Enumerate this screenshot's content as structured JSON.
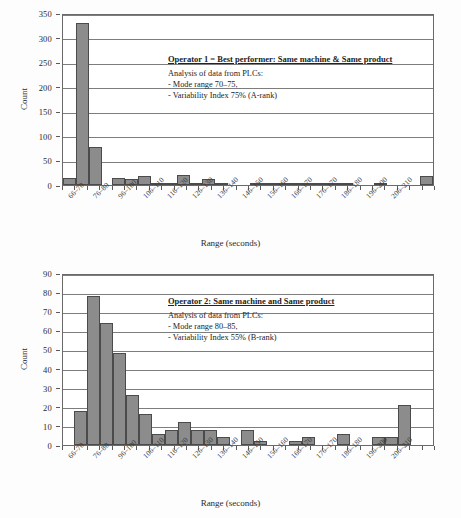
{
  "chart_data": [
    {
      "type": "bar",
      "panel": "top",
      "title": "",
      "xlabel": "Range (seconds)",
      "ylabel": "Count",
      "ylim": [
        0,
        350
      ],
      "yticks": [
        0,
        50,
        100,
        150,
        200,
        250,
        300,
        350
      ],
      "grid": true,
      "legend": "none",
      "tick_labels": [
        "66–70",
        "76–80",
        "96–100",
        "106–110",
        "116–120",
        "126–130",
        "136–140",
        "146–150",
        "156–160",
        "166–170",
        "176–170",
        "186–180",
        "196–200",
        "206–210"
      ],
      "categories": [
        "66–70",
        "71–75",
        "76–80",
        "81–85",
        "86–90",
        "91–95",
        "96–100",
        "101–105",
        "106–110",
        "111–115",
        "116–120",
        "121–125",
        "126–130",
        "131–135",
        "136–140",
        "141–145",
        "146–150",
        "151–155",
        "156–160",
        "161–165",
        "166–170",
        "171–175",
        "176–180",
        "181–185",
        "186–190",
        "191–195",
        "196–200",
        "201–205",
        "206–210",
        "211–215"
      ],
      "values": [
        14,
        330,
        77,
        0,
        14,
        13,
        18,
        5,
        5,
        20,
        5,
        12,
        5,
        0,
        0,
        3,
        4,
        3,
        3,
        3,
        4,
        2,
        3,
        0,
        0,
        3,
        0,
        0,
        0,
        18
      ],
      "annotation": {
        "title": "Operator 1 = Best performer: Same machine & Same product",
        "lines": [
          "Analysis of data from PLCs:",
          "- Mode range 70–75,",
          "- Variability Index 75% (A-rank)"
        ]
      }
    },
    {
      "type": "bar",
      "panel": "bottom",
      "title": "",
      "xlabel": "Range (seconds)",
      "ylabel": "Count",
      "ylim": [
        0,
        90
      ],
      "yticks": [
        0,
        10,
        20,
        30,
        40,
        50,
        60,
        70,
        80,
        90
      ],
      "grid": true,
      "legend": "none",
      "tick_labels": [
        "66–70",
        "76–80",
        "96–100",
        "106–110",
        "116–120",
        "126–130",
        "136–140",
        "146–150",
        "156–160",
        "166–170",
        "176–170",
        "186–180",
        "196–200",
        "206–210"
      ],
      "categories": [
        "66–70",
        "71–75",
        "76–80",
        "81–85",
        "86–90",
        "91–95",
        "96–100",
        "101–105",
        "106–110",
        "111–115",
        "116–120",
        "121–125",
        "126–130",
        "131–135",
        "136–140",
        "141–145",
        "146–150",
        "151–155",
        "156–160",
        "161–165",
        "166–170",
        "171–175",
        "176–180",
        "181–185",
        "186–190",
        "191–195",
        "196–200",
        "201–205",
        "206–210",
        "211–215"
      ],
      "values": [
        0,
        18,
        78,
        64,
        48,
        26,
        16,
        6,
        8,
        12,
        8,
        8,
        4,
        0,
        8,
        2,
        0,
        0,
        2,
        4,
        0,
        0,
        6,
        0,
        0,
        4,
        4,
        21,
        0,
        0
      ],
      "annotation": {
        "title": "Operator 2: Same machine and Same product",
        "lines": [
          "Analysis of data from PLCs:",
          "- Mode range 80–85,",
          "- Variability Index 55% (B-rank)"
        ]
      }
    }
  ]
}
